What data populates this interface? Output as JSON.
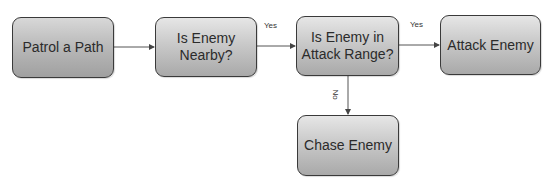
{
  "diagram": {
    "type": "flowchart",
    "nodes": [
      {
        "id": "patrol",
        "label": "Patrol a Path"
      },
      {
        "id": "nearby",
        "label": "Is Enemy Nearby?"
      },
      {
        "id": "in_range",
        "label": "Is Enemy in Attack Range?"
      },
      {
        "id": "attack",
        "label": "Attack Enemy"
      },
      {
        "id": "chase",
        "label": "Chase Enemy"
      }
    ],
    "edges": [
      {
        "from": "patrol",
        "to": "nearby",
        "label": ""
      },
      {
        "from": "nearby",
        "to": "in_range",
        "label": "Yes"
      },
      {
        "from": "in_range",
        "to": "attack",
        "label": "Yes"
      },
      {
        "from": "in_range",
        "to": "chase",
        "label": "No"
      }
    ],
    "colors": {
      "box_border": "#3a3a3a",
      "box_fill_top": "#e6e6e6",
      "box_fill_bottom": "#a9a9a9",
      "arrow": "#444444",
      "text": "#2b2b2b"
    }
  }
}
